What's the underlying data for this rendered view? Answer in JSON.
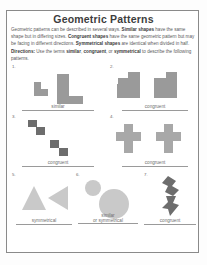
{
  "worksheet": {
    "title": "Geometric Patterns",
    "intro_html": "Geometric patterns can be described in several ways. <b>Similar shapes</b> have the same shape but in differing sizes. <b>Congruent shapes</b> have the same geometric pattern but may be facing in different directions. <b>Symmetrical shapes</b> are identical when divided in half.",
    "directions_html": "<b>Directions:</b> Use the terms <b>similar</b>, <b>congruent</b>, or <b>symmetrical</b> to describe the following patterns."
  },
  "problems": [
    {
      "number": "1.",
      "answer": "similar",
      "answer_line2": "",
      "shape_kind": "l-shapes-different-sizes",
      "fill": "#9a9a9a"
    },
    {
      "number": "2.",
      "answer": "congruent",
      "answer_line2": "",
      "shape_kind": "staircase-mirrored-pair",
      "fill": "#8e8e8e"
    },
    {
      "number": "3.",
      "answer": "congruent",
      "answer_line2": "",
      "shape_kind": "zigzag-step-pair",
      "fill": "#7d7d7d"
    },
    {
      "number": "4.",
      "answer": "congruent",
      "answer_line2": "",
      "shape_kind": "cross-pair",
      "fill": "#a5a5a5"
    },
    {
      "number": "5.",
      "answer": "symmetrical",
      "answer_line2": "",
      "shape_kind": "triangle-pair",
      "fill": "#cfcfcf"
    },
    {
      "number": "6.",
      "answer": "similar",
      "answer_line2": "or symmetrical",
      "shape_kind": "circle-pair-different-sizes",
      "fill": "#bdbdbd"
    },
    {
      "number": "7.",
      "answer": "congruent",
      "answer_line2": "",
      "shape_kind": "arrow-zigzag-pair",
      "fill": "#555555"
    }
  ]
}
